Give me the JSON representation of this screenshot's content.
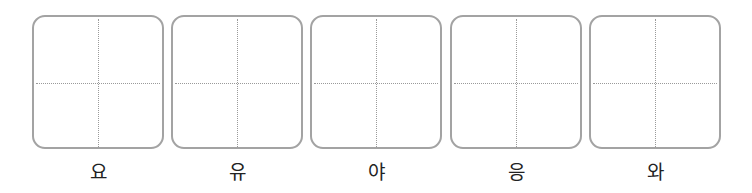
{
  "worksheet": {
    "cells": [
      {
        "label": "요"
      },
      {
        "label": "유"
      },
      {
        "label": "야"
      },
      {
        "label": "응"
      },
      {
        "label": "와"
      }
    ]
  },
  "colors": {
    "box_border": "#a3a3a3",
    "guide_dots": "#9a9a9a",
    "label_text": "#222222"
  }
}
